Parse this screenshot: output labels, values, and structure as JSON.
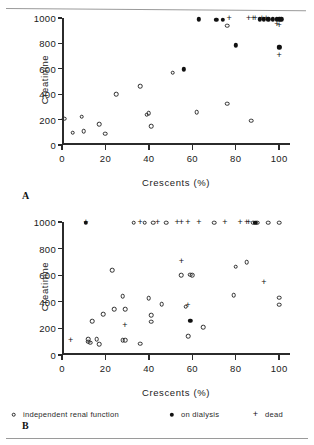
{
  "figure": {
    "panel_a_letter": "A",
    "panel_b_letter": "B"
  },
  "legend": {
    "items": [
      {
        "symbol": "open-circle-icon",
        "label": "independent renal function"
      },
      {
        "symbol": "filled-circle-icon",
        "label": "on dialysis"
      },
      {
        "symbol": "plus-icon",
        "label": "dead"
      }
    ]
  },
  "chart_data": [
    {
      "type": "scatter",
      "panel": "A",
      "title": "",
      "xlabel": "Crescents  (%)",
      "ylabel": "Creatinine",
      "xlim": [
        0,
        105
      ],
      "ylim": [
        0,
        1000
      ],
      "xticks": [
        0,
        20,
        40,
        60,
        80,
        100
      ],
      "yticks": [
        0,
        200,
        400,
        600,
        800,
        1000
      ],
      "xtick_labels": [
        "0",
        "20",
        "40",
        "60",
        "80",
        "100"
      ],
      "ytick_labels": [
        "0",
        "200",
        "400",
        "600",
        "800",
        "1000"
      ],
      "grid": false,
      "legend_position": "below-figure",
      "series": [
        {
          "name": "independent renal function",
          "marker": "open-circle",
          "points": [
            [
              1,
              208
            ],
            [
              5,
              97
            ],
            [
              9,
              222
            ],
            [
              10,
              110
            ],
            [
              17,
              163
            ],
            [
              20,
              90
            ],
            [
              25,
              402
            ],
            [
              36,
              463
            ],
            [
              39,
              237
            ],
            [
              40,
              252
            ],
            [
              41,
              150
            ],
            [
              51,
              570
            ],
            [
              62,
              258
            ],
            [
              76,
              940
            ],
            [
              76,
              325
            ],
            [
              87,
              190
            ]
          ]
        },
        {
          "name": "on dialysis",
          "marker": "filled-circle",
          "points": [
            [
              56,
              595
            ],
            [
              63,
              990
            ],
            [
              71,
              988
            ],
            [
              74,
              988
            ],
            [
              80,
              786
            ],
            [
              91,
              990
            ],
            [
              93,
              990
            ],
            [
              95,
              990
            ],
            [
              97,
              990
            ],
            [
              99,
              990
            ],
            [
              100,
              990
            ],
            [
              101,
              990
            ],
            [
              100,
              775
            ],
            [
              100,
              765
            ]
          ]
        },
        {
          "name": "dead",
          "marker": "plus",
          "points": [
            [
              77,
              990
            ],
            [
              86,
              990
            ],
            [
              88,
              990
            ],
            [
              89,
              990
            ],
            [
              92,
              990
            ],
            [
              94,
              990
            ],
            [
              99,
              945
            ],
            [
              100,
              940
            ],
            [
              100,
              700
            ]
          ]
        }
      ]
    },
    {
      "type": "scatter",
      "panel": "B",
      "title": "",
      "xlabel": "Crescents  (%)",
      "ylabel": "Creatinine",
      "xlim": [
        0,
        105
      ],
      "ylim": [
        0,
        1000
      ],
      "xticks": [
        0,
        20,
        40,
        60,
        80,
        100
      ],
      "yticks": [
        0,
        200,
        400,
        600,
        800,
        1000
      ],
      "xtick_labels": [
        "0",
        "20",
        "40",
        "60",
        "80",
        "100"
      ],
      "ytick_labels": [
        "0",
        "200",
        "400",
        "600",
        "800",
        "1000"
      ],
      "grid": false,
      "legend_position": "below-figure",
      "series": [
        {
          "name": "independent renal function",
          "marker": "open-circle",
          "points": [
            [
              12,
              118
            ],
            [
              12,
              100
            ],
            [
              13,
              92
            ],
            [
              14,
              255
            ],
            [
              16,
              118
            ],
            [
              17,
              80
            ],
            [
              19,
              305
            ],
            [
              23,
              638
            ],
            [
              24,
              345
            ],
            [
              28,
              112
            ],
            [
              28,
              442
            ],
            [
              29,
              345
            ],
            [
              29,
              112
            ],
            [
              33,
              995
            ],
            [
              36,
              85
            ],
            [
              38,
              995
            ],
            [
              40,
              428
            ],
            [
              41,
              300
            ],
            [
              41,
              250
            ],
            [
              42,
              995
            ],
            [
              46,
              382
            ],
            [
              48,
              995
            ],
            [
              55,
              600
            ],
            [
              57,
              363
            ],
            [
              58,
              140
            ],
            [
              59,
              605
            ],
            [
              60,
              598
            ],
            [
              65,
              207
            ],
            [
              70,
              995
            ],
            [
              79,
              448
            ],
            [
              80,
              665
            ],
            [
              85,
              697
            ],
            [
              88,
              995
            ],
            [
              90,
              995
            ],
            [
              95,
              995
            ],
            [
              100,
              430
            ],
            [
              100,
              378
            ],
            [
              100,
              995
            ]
          ]
        },
        {
          "name": "on dialysis",
          "marker": "filled-circle",
          "points": [
            [
              11,
              995
            ],
            [
              59,
              255
            ],
            [
              89,
              995
            ]
          ]
        },
        {
          "name": "dead",
          "marker": "plus",
          "points": [
            [
              4,
              108
            ],
            [
              11,
              995
            ],
            [
              29,
              220
            ],
            [
              36,
              995
            ],
            [
              44,
              995
            ],
            [
              53,
              995
            ],
            [
              55,
              995
            ],
            [
              55,
              700
            ],
            [
              58,
              995
            ],
            [
              58,
              365
            ],
            [
              63,
              995
            ],
            [
              75,
              995
            ],
            [
              82,
              995
            ],
            [
              85,
              995
            ],
            [
              86,
              995
            ],
            [
              93,
              540
            ]
          ]
        }
      ]
    }
  ]
}
